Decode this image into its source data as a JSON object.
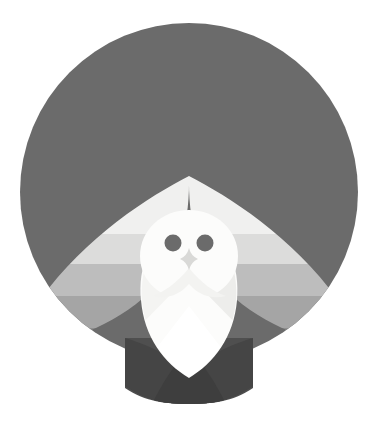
{
  "artwork": {
    "title": "Flat Geometric Owl",
    "subject": "owl",
    "style": "flat-vector-geometric",
    "background_color": "#ffffff",
    "canvas": {
      "width": 378,
      "height": 428
    }
  },
  "palette": {
    "background": "#ffffff",
    "disc": "#6b6b6b",
    "wing_band_1": "#f0f0ef",
    "wing_band_2": "#dcdcdb",
    "wing_band_3": "#bdbdbd",
    "wing_band_4": "#a5a5a5",
    "wing_band_5": "#8e8e8e",
    "body_white": "#fcfcfb",
    "body_shade": "#ededeb",
    "eye": "#6b6b6b",
    "beak": "#d9d9d7",
    "tail_light": "#5f5f5f",
    "tail_mid": "#4f4f4f",
    "tail_dark": "#3e3e3e"
  },
  "geometry": {
    "disc": {
      "cx": 189,
      "cy": 192,
      "r": 169
    },
    "head": {
      "cx": 189,
      "cy": 253,
      "rx": 48,
      "ry": 44,
      "top_y": 211
    },
    "eyes": [
      {
        "name": "left-eye",
        "cx": 173,
        "cy": 243,
        "r": 8.5
      },
      {
        "name": "right-eye",
        "cx": 205,
        "cy": 243,
        "r": 8.5
      }
    ],
    "beak": {
      "cx": 189,
      "cy": 259,
      "half_w": 9,
      "half_h": 11
    },
    "body": {
      "top_y": 250,
      "tip_y": 376,
      "half_w": 44
    },
    "wing_span": {
      "left_x": 20,
      "right_x": 358,
      "fold_y": 190,
      "tip_y": 355
    },
    "tail": {
      "top_y": 338,
      "bottom_y": 403,
      "left_x": 125,
      "right_x": 253
    }
  },
  "elements": {
    "disc_label": "head-disc",
    "left_wing_label": "left-wing",
    "right_wing_label": "right-wing",
    "head_label": "owl-head",
    "body_label": "owl-body",
    "tail_label": "owl-tail",
    "beak_label": "owl-beak"
  },
  "layers": [
    {
      "name": "background",
      "color": "#ffffff"
    },
    {
      "name": "disc",
      "color": "#6b6b6b"
    },
    {
      "name": "left-wing",
      "color": "gradient-bands"
    },
    {
      "name": "right-wing",
      "color": "gradient-bands"
    },
    {
      "name": "tail",
      "color": "#4f4f4f"
    },
    {
      "name": "body",
      "color": "#fcfcfb"
    },
    {
      "name": "head",
      "color": "#fcfcfb"
    },
    {
      "name": "eyes",
      "color": "#6b6b6b"
    },
    {
      "name": "beak",
      "color": "#d9d9d7"
    }
  ],
  "wing_bands": [
    {
      "index": 1,
      "y_top": 190,
      "y_bottom": 232,
      "color": "#f0f0ef"
    },
    {
      "index": 2,
      "y_top": 232,
      "y_bottom": 262,
      "color": "#dcdcdb"
    },
    {
      "index": 3,
      "y_top": 262,
      "y_bottom": 294,
      "color": "#bdbdbd"
    },
    {
      "index": 4,
      "y_top": 294,
      "y_bottom": 326,
      "color": "#a5a5a5"
    },
    {
      "index": 5,
      "y_top": 326,
      "y_bottom": 362,
      "color": "#8e8e8e"
    }
  ]
}
